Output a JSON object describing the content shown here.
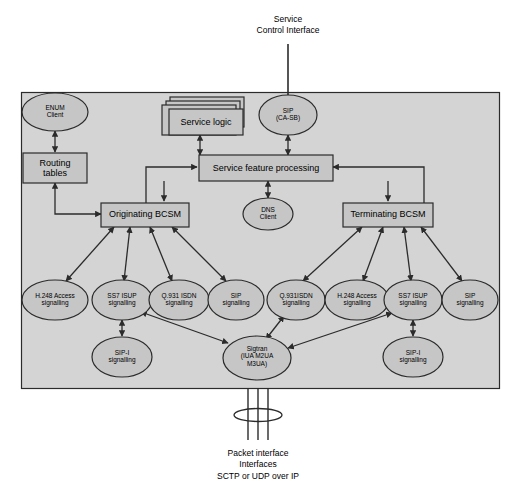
{
  "figure": {
    "top_caption": "Service\nControl Interface",
    "bottom_caption": "Packet interface\nInterfaces\nSCTP or UDP over IP"
  },
  "colors": {
    "panel_fill": "#d4d4d4",
    "node_fill": "#c6c6c6",
    "stroke": "#2b2b2b",
    "page_bg": "#ffffff",
    "text": "#000000"
  },
  "nodes": {
    "enum_client": "ENUM\nClient",
    "routing_tables": "Routing\ntables",
    "service_logic": "Service logic",
    "sip_casb": "SIP\n(CA-SB)",
    "service_feature_processing": "Service feature processing",
    "dns_client": "DNS\nClient",
    "originating_bcsm": "Originating BCSM",
    "terminating_bcsm": "Terminating BCSM",
    "h248_left": "H.248 Access\nsignalling",
    "ss7_isup_left": "SS7 ISUP\nsignalling",
    "q931_isdn_left": "Q.931 ISDN\nsignalling",
    "sip_left": "SIP\nsignalling",
    "sipi_left": "SIP-I\nsignalling",
    "q931_isdn_right": "Q.931ISDN\nsignalling",
    "h248_right": "H.248 Access\nsignalling",
    "ss7_isup_right": "SS7 ISUP\nsignalling",
    "sip_right": "SIP\nsignalling",
    "sipi_right": "SIP-I\nsignalling",
    "sigtran": "Sigtran\n(IUA M2UA\nM3UA)"
  }
}
